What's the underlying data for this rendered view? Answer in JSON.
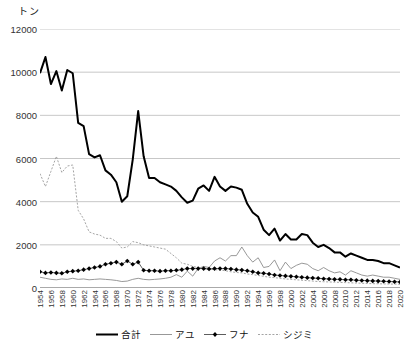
{
  "unit_label": "トン",
  "legend": {
    "position": "bottom-center",
    "items": [
      {
        "label": "合計",
        "style": "thick-solid-black",
        "color": "#000000"
      },
      {
        "label": "アユ",
        "style": "thin-solid-gray",
        "color": "#8c8c8c"
      },
      {
        "label": "フナ",
        "style": "solid-with-diamond-markers",
        "color": "#000000"
      },
      {
        "label": "シジミ",
        "style": "dotted-gray",
        "color": "#9a9a9a"
      }
    ]
  },
  "chart_data": {
    "type": "line",
    "title": "",
    "xlabel": "",
    "ylabel": "トン",
    "ylim": [
      0,
      12000
    ],
    "ytick_labels": [
      "0",
      "2000",
      "4000",
      "6000",
      "8000",
      "10000",
      "12000"
    ],
    "ytick_values": [
      0,
      2000,
      4000,
      6000,
      8000,
      10000,
      12000
    ],
    "grid": true,
    "grid_axis": "y",
    "x": [
      1954,
      1955,
      1956,
      1957,
      1958,
      1959,
      1960,
      1961,
      1962,
      1963,
      1964,
      1965,
      1966,
      1967,
      1968,
      1969,
      1970,
      1971,
      1972,
      1973,
      1974,
      1975,
      1976,
      1977,
      1978,
      1979,
      1980,
      1981,
      1982,
      1983,
      1984,
      1985,
      1986,
      1987,
      1988,
      1989,
      1990,
      1991,
      1992,
      1993,
      1994,
      1995,
      1996,
      1997,
      1998,
      1999,
      2000,
      2001,
      2002,
      2003,
      2004,
      2005,
      2006,
      2007,
      2008,
      2009,
      2010,
      2011,
      2012,
      2013,
      2014,
      2015,
      2016,
      2017,
      2018,
      2019,
      2020
    ],
    "xtick_labels": [
      "1954",
      "1956",
      "1958",
      "1960",
      "1962",
      "1964",
      "1966",
      "1968",
      "1970",
      "1972",
      "1974",
      "1976",
      "1978",
      "1980",
      "1982",
      "1984",
      "1986",
      "1988",
      "1990",
      "1992",
      "1994",
      "1996",
      "1998",
      "2000",
      "2002",
      "2004",
      "2006",
      "2008",
      "2010",
      "2012",
      "2014",
      "2016",
      "2018",
      "2020"
    ],
    "xtick_step": 2,
    "series": [
      {
        "name": "合計",
        "values": [
          9950,
          10700,
          9450,
          10050,
          9150,
          10100,
          9950,
          7650,
          7500,
          6200,
          6050,
          6150,
          5450,
          5250,
          4900,
          4000,
          4250,
          5950,
          8200,
          6100,
          5100,
          5100,
          4900,
          4800,
          4700,
          4500,
          4200,
          3950,
          4050,
          4600,
          4750,
          4500,
          5150,
          4700,
          4500,
          4700,
          4650,
          4550,
          3900,
          3500,
          3300,
          2700,
          2450,
          2750,
          2200,
          2500,
          2250,
          2250,
          2500,
          2450,
          2100,
          1900,
          2000,
          1850,
          1650,
          1650,
          1450,
          1600,
          1500,
          1400,
          1300,
          1300,
          1250,
          1150,
          1150,
          1050,
          950
        ]
      },
      {
        "name": "アユ",
        "values": [
          500,
          450,
          400,
          380,
          420,
          400,
          450,
          400,
          420,
          380,
          400,
          420,
          400,
          380,
          350,
          300,
          320,
          400,
          450,
          400,
          380,
          400,
          420,
          450,
          500,
          620,
          500,
          780,
          550,
          900,
          1000,
          950,
          1250,
          1400,
          1250,
          1500,
          1500,
          1900,
          1500,
          1200,
          1400,
          950,
          1000,
          1300,
          800,
          1200,
          900,
          1050,
          1150,
          1100,
          900,
          800,
          950,
          800,
          700,
          750,
          600,
          800,
          700,
          600,
          550,
          600,
          550,
          500,
          500,
          450,
          400
        ]
      },
      {
        "name": "フナ",
        "values": [
          750,
          700,
          720,
          700,
          680,
          750,
          780,
          800,
          850,
          900,
          950,
          1000,
          1100,
          1150,
          1200,
          1100,
          1250,
          1100,
          1200,
          820,
          800,
          800,
          780,
          800,
          800,
          820,
          850,
          900,
          900,
          900,
          900,
          880,
          900,
          900,
          900,
          880,
          850,
          830,
          800,
          750,
          700,
          680,
          650,
          600,
          580,
          560,
          540,
          520,
          500,
          480,
          460,
          450,
          430,
          420,
          400,
          400,
          380,
          380,
          360,
          350,
          340,
          330,
          320,
          310,
          300,
          290,
          280
        ]
      },
      {
        "name": "シジミ",
        "values": [
          5300,
          4700,
          5400,
          6100,
          5350,
          5650,
          5700,
          3600,
          3200,
          2600,
          2500,
          2450,
          2300,
          2300,
          2150,
          1850,
          1900,
          2150,
          2100,
          2000,
          1950,
          1900,
          1850,
          1800,
          1600,
          1400,
          1150,
          1100,
          1000,
          950,
          900,
          880,
          850,
          830,
          800,
          750,
          720,
          700,
          650,
          620,
          580,
          540,
          500,
          480,
          450,
          420,
          400,
          380,
          360,
          340,
          320,
          300,
          290,
          280,
          270,
          260,
          250,
          240,
          230,
          220,
          210,
          200,
          195,
          190,
          185,
          180,
          175
        ]
      }
    ]
  }
}
